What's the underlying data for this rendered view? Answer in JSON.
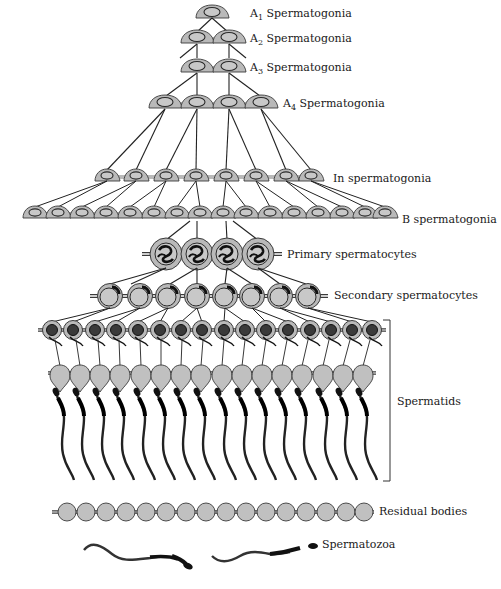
{
  "colors": {
    "cell_fill": "#b9b9b9",
    "nucleus_fill": "#c8c8c8",
    "outline": "#3a3a3a",
    "chromatin": "#1a1a1a",
    "line": "#222222",
    "text": "#1a1a1a"
  },
  "stages": [
    {
      "id": "a1",
      "prefix": "A",
      "sub": "1",
      "label": " Spermatogonia",
      "count": 1,
      "y": 14
    },
    {
      "id": "a2",
      "prefix": "A",
      "sub": "2",
      "label": " Spermatogonia",
      "count": 2,
      "y": 40
    },
    {
      "id": "a3",
      "prefix": "A",
      "sub": "3",
      "label": " Spermatogonia",
      "count": 2,
      "y": 69
    },
    {
      "id": "a4",
      "prefix": "A",
      "sub": "4",
      "label": " Spermatogonia",
      "count": 4,
      "y": 105
    },
    {
      "id": "in",
      "prefix": "",
      "sub": "",
      "label": "In spermatogonia",
      "count": 8,
      "y": 179
    },
    {
      "id": "b",
      "prefix": "",
      "sub": "",
      "label": "B spermatogonia",
      "count": 16,
      "y": 215
    },
    {
      "id": "primary",
      "prefix": "",
      "sub": "",
      "label": "Primary spermatocytes",
      "count": 4,
      "y": 255
    },
    {
      "id": "secondary",
      "prefix": "",
      "sub": "",
      "label": "Secondary spermatocytes",
      "count": 7,
      "y": 296
    },
    {
      "id": "spermatids",
      "prefix": "",
      "sub": "",
      "label": "Spermatids",
      "count": 16,
      "y": 412
    },
    {
      "id": "residual",
      "prefix": "",
      "sub": "",
      "label": "Residual bodies",
      "count": 16,
      "y": 510
    },
    {
      "id": "spermatozoa",
      "prefix": "",
      "sub": "",
      "label": "Spermatozoa",
      "count": 2,
      "y": 545
    }
  ],
  "labels": {
    "a1": "A1 Spermatogonia",
    "a2": "A2 Spermatogonia",
    "a3": "A3 Spermatogonia",
    "a4": "A4 Spermatogonia",
    "in": "In spermatogonia",
    "b": "B spermatogonia",
    "primary": "Primary spermatocytes",
    "secondary": "Secondary spermatocytes",
    "spermatids": "Spermatids",
    "residual": "Residual bodies",
    "spermatozoa": "Spermatozoa"
  },
  "label_parts": {
    "a1": {
      "letter": "A",
      "sub": "1",
      "rest": " Spermatogonia"
    },
    "a2": {
      "letter": "A",
      "sub": "2",
      "rest": " Spermatogonia"
    },
    "a3": {
      "letter": "A",
      "sub": "3",
      "rest": " Spermatogonia"
    },
    "a4": {
      "letter": "A",
      "sub": "4",
      "rest": " Spermatogonia"
    }
  }
}
